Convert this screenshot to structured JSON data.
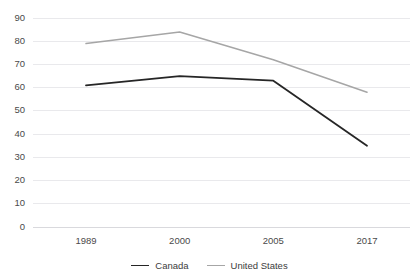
{
  "chart_data": {
    "type": "line",
    "title": "",
    "subtitle": "",
    "xlabel": "",
    "ylabel": "",
    "categories": [
      "1989",
      "2000",
      "2005",
      "2017"
    ],
    "series": [
      {
        "name": "Canada",
        "values": [
          61,
          65,
          63,
          35
        ],
        "color": "#262626"
      },
      {
        "name": "United States",
        "values": [
          79,
          84,
          72,
          58
        ],
        "color": "#a6a6a6"
      }
    ],
    "ylim": [
      0,
      90
    ],
    "ytick_labels": [
      "0",
      "10",
      "20",
      "30",
      "40",
      "50",
      "60",
      "70",
      "80",
      "90"
    ],
    "ytick_values": [
      0,
      10,
      20,
      30,
      40,
      50,
      60,
      70,
      80,
      90
    ],
    "grid": true,
    "grid_axis": "y",
    "legend_position": "bottom-center",
    "background_color": "#ffffff",
    "gridline_color": "#e9e9ec",
    "tick_label_color": "#4a4a4a"
  },
  "legend": {
    "items": [
      {
        "label": "Canada"
      },
      {
        "label": "United States"
      }
    ]
  }
}
